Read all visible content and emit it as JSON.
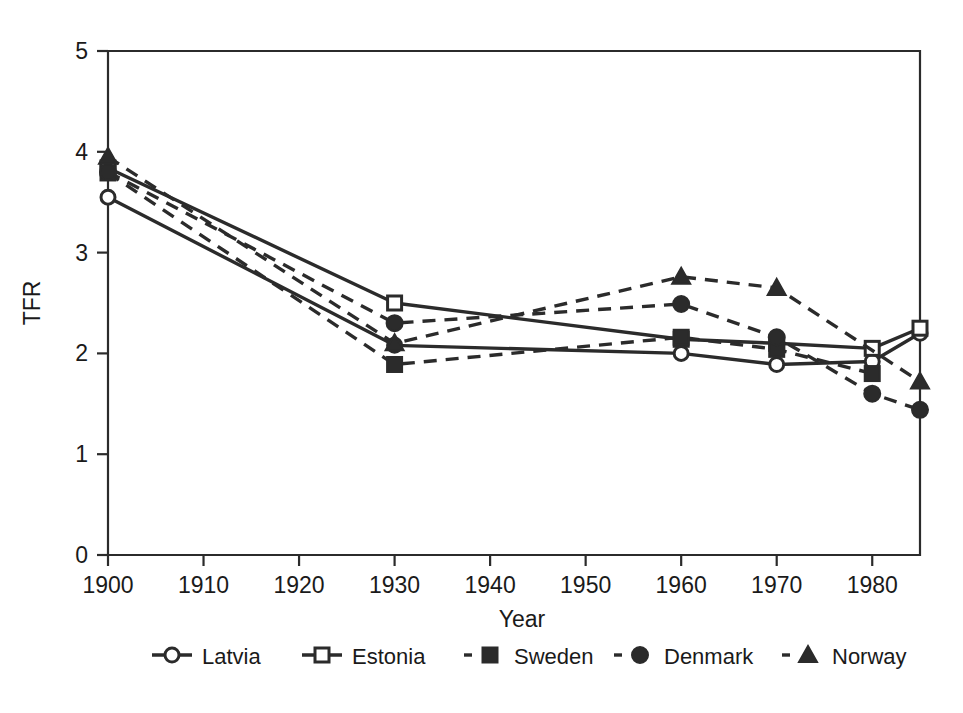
{
  "chart_data": {
    "type": "line",
    "title": "",
    "subtitle": "",
    "xlabel": "Year",
    "ylabel": "TFR",
    "xlim": [
      1900,
      1985
    ],
    "ylim": [
      0,
      5
    ],
    "xticks": [
      1900,
      1910,
      1920,
      1930,
      1940,
      1950,
      1960,
      1970,
      1980
    ],
    "xticklabels": [
      "1900",
      "1910",
      "1920",
      "1930",
      "1940",
      "1950",
      "1960",
      "1970",
      "1980"
    ],
    "yticks": [
      0,
      1,
      2,
      3,
      4,
      5
    ],
    "yticklabels": [
      "0",
      "1",
      "2",
      "3",
      "4",
      "5"
    ],
    "grid": false,
    "legend_position": "below",
    "series": [
      {
        "name": "Latvia",
        "linestyle": "solid",
        "marker": "open-circle",
        "color": "#2b2b2b",
        "x": [
          1900,
          1930,
          1960,
          1970,
          1980,
          1985
        ],
        "values": [
          3.55,
          2.08,
          2.0,
          1.89,
          1.92,
          2.2
        ]
      },
      {
        "name": "Estonia",
        "linestyle": "solid",
        "marker": "open-square",
        "color": "#2b2b2b",
        "x": [
          1900,
          1930,
          1960,
          1970,
          1980,
          1985
        ],
        "values": [
          3.84,
          2.5,
          2.14,
          2.1,
          2.05,
          2.25
        ]
      },
      {
        "name": "Sweden",
        "linestyle": "dashed",
        "marker": "filled-square",
        "color": "#2b2b2b",
        "x": [
          1900,
          1930,
          1960,
          1970,
          1980
        ],
        "values": [
          3.79,
          1.89,
          2.16,
          2.04,
          1.8
        ]
      },
      {
        "name": "Denmark",
        "linestyle": "dashed",
        "marker": "filled-circle",
        "color": "#2b2b2b",
        "x": [
          1900,
          1930,
          1960,
          1970,
          1980,
          1985
        ],
        "values": [
          3.8,
          2.3,
          2.49,
          2.16,
          1.6,
          1.44
        ]
      },
      {
        "name": "Norway",
        "linestyle": "dashed",
        "marker": "filled-triangle",
        "color": "#2b2b2b",
        "x": [
          1900,
          1930,
          1960,
          1970,
          1985
        ],
        "values": [
          3.95,
          2.1,
          2.76,
          2.65,
          1.72
        ]
      }
    ]
  },
  "legend": {
    "entries": [
      {
        "label": "Latvia",
        "marker": "open-circle",
        "linestyle": "solid"
      },
      {
        "label": "Estonia",
        "marker": "open-square",
        "linestyle": "solid"
      },
      {
        "label": "Sweden",
        "marker": "filled-square",
        "linestyle": "dashed"
      },
      {
        "label": "Denmark",
        "marker": "filled-circle",
        "linestyle": "dashed"
      },
      {
        "label": "Norway",
        "marker": "filled-triangle",
        "linestyle": "dashed"
      }
    ]
  },
  "axes": {
    "x_title": "Year",
    "y_title": "TFR"
  },
  "colors": {
    "ink": "#2b2b2b",
    "background": "#ffffff"
  }
}
